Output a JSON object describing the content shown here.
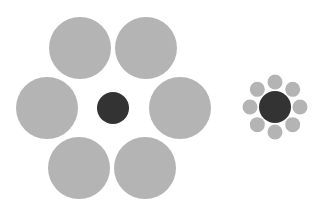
{
  "colors": {
    "background": "#ffffff",
    "surround": "#b4b4b4",
    "center": "#333333"
  },
  "groups": [
    {
      "name": "large-surround-group",
      "surround_count": 6,
      "surround_size": "large"
    },
    {
      "name": "small-surround-group",
      "surround_count": 8,
      "surround_size": "small"
    }
  ]
}
